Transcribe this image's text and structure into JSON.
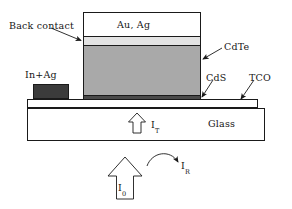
{
  "figure": {
    "kind": "cross-section-diagram",
    "background": "#ffffff",
    "line_color": "#1a1a1a"
  },
  "labels": {
    "back_contact": "Back contact",
    "au_ag": "Au, Ag",
    "cdte": "CdTe",
    "cds": "CdS",
    "tco": "TCO",
    "glass": "Glass",
    "in_ag": "In+Ag",
    "i_t": "I",
    "i_t_sub": "T",
    "i_r": "I",
    "i_r_sub": "R",
    "i_0": "I",
    "i_0_sub": "0"
  },
  "layers": [
    {
      "name": "Au, Ag",
      "fill": "#ffffff",
      "role": "metal-top-contact"
    },
    {
      "name": "Back contact",
      "fill": "#e3e3e3",
      "role": "back-contact-interlayer"
    },
    {
      "name": "CdTe",
      "fill": "#a9a9a9",
      "role": "absorber"
    },
    {
      "name": "CdS",
      "fill": "#4a4a4a",
      "role": "window-layer"
    },
    {
      "name": "TCO",
      "fill": "#ffffff",
      "role": "transparent-conductive-oxide"
    },
    {
      "name": "Glass",
      "fill": "#ffffff",
      "role": "substrate"
    },
    {
      "name": "In+Ag",
      "fill": "#3b3b3b",
      "role": "front-contact-pad"
    }
  ],
  "arrows": [
    {
      "name": "I_T",
      "type": "hollow-block-up",
      "meaning": "transmitted light"
    },
    {
      "name": "I_0",
      "type": "hollow-block-up",
      "meaning": "incident light"
    },
    {
      "name": "I_R",
      "type": "curved-line",
      "meaning": "reflected light"
    }
  ]
}
